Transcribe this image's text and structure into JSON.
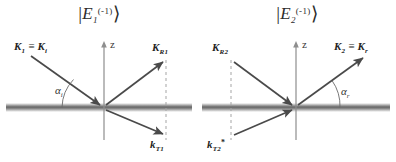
{
  "figure": {
    "background": "#ffffff",
    "line_color": "#4a4a4a",
    "text_color": "#232323",
    "interface_color": "#8a8a8a",
    "dashed_color": "#9a9a9a"
  },
  "panels": [
    {
      "id": "panel-left",
      "ket": {
        "open": "|",
        "symbol": "E",
        "sub": "1",
        "sup": "(-1)",
        "close": "⟩"
      },
      "axis_label": "z",
      "angle_label": {
        "symbol": "α",
        "sub": "i"
      },
      "vectors": [
        {
          "name": "incident",
          "label_main": "K",
          "label_sub": "1",
          "equiv": "≡",
          "label_main2": "K",
          "label_sub2": "i"
        },
        {
          "name": "reflected",
          "label_main": "K",
          "label_sub": "R1"
        },
        {
          "name": "transmitted",
          "label_main": "k",
          "label_sub": "T1"
        }
      ]
    },
    {
      "id": "panel-right",
      "ket": {
        "open": "|",
        "symbol": "E",
        "sub": "2",
        "sup": "(-1)",
        "close": "⟩"
      },
      "axis_label": "z",
      "angle_label": {
        "symbol": "α",
        "sub": "r"
      },
      "vectors": [
        {
          "name": "incoming-upper-left",
          "label_main": "K",
          "label_sub": "R2"
        },
        {
          "name": "incoming-lower-left",
          "label_main": "k",
          "label_sub": "T2",
          "prime": "*"
        },
        {
          "name": "outgoing-upper-right",
          "label_main": "K",
          "label_sub": "2",
          "equiv": "≡",
          "label_main2": "K",
          "label_sub2": "r"
        }
      ]
    }
  ]
}
